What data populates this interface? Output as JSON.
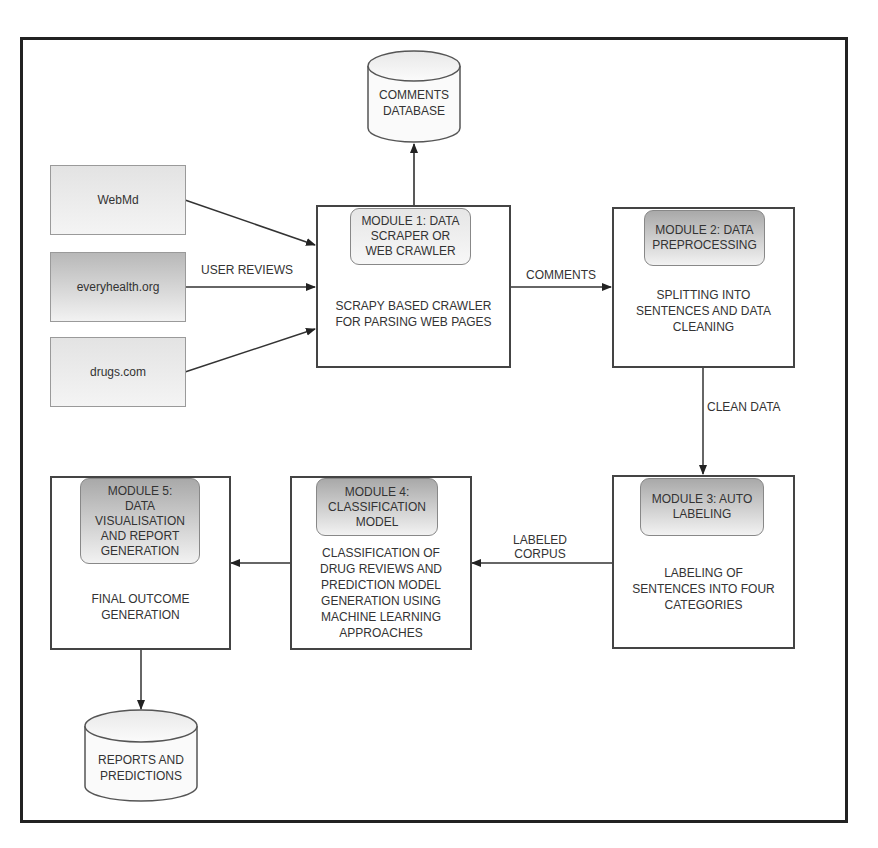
{
  "diagram": {
    "sources": [
      {
        "id": "webmd",
        "label": "WebMd"
      },
      {
        "id": "everyhealth",
        "label": "everyhealth.org"
      },
      {
        "id": "drugs",
        "label": "drugs.com"
      }
    ],
    "databases": {
      "comments": {
        "line1": "COMMENTS",
        "line2": "DATABASE"
      },
      "reports": {
        "line1": "REPORTS AND",
        "line2": "PREDICTIONS"
      }
    },
    "modules": [
      {
        "id": "m1",
        "title": [
          "MODULE 1: DATA",
          "SCRAPER OR",
          "WEB CRAWLER"
        ],
        "description": [
          "SCRAPY BASED CRAWLER",
          "FOR PARSING WEB PAGES"
        ]
      },
      {
        "id": "m2",
        "title": [
          "MODULE 2: DATA",
          "PREPROCESSING"
        ],
        "description": [
          "SPLITTING INTO",
          "SENTENCES AND DATA",
          "CLEANING"
        ]
      },
      {
        "id": "m3",
        "title": [
          "MODULE 3: AUTO",
          "LABELING"
        ],
        "description": [
          "LABELING OF",
          "SENTENCES INTO FOUR",
          "CATEGORIES"
        ]
      },
      {
        "id": "m4",
        "title": [
          "MODULE 4:",
          "CLASSIFICATION",
          "MODEL"
        ],
        "description": [
          "CLASSIFICATION OF",
          "DRUG REVIEWS AND",
          "PREDICTION MODEL",
          "GENERATION USING",
          "MACHINE LEARNING",
          "APPROACHES"
        ]
      },
      {
        "id": "m5",
        "title": [
          "MODULE 5:",
          "DATA",
          "VISUALISATION",
          "AND REPORT",
          "GENERATION"
        ],
        "description": [
          "FINAL OUTCOME",
          "GENERATION"
        ]
      }
    ],
    "edges": {
      "user_reviews": "USER REVIEWS",
      "comments": "COMMENTS",
      "clean_data": "CLEAN DATA",
      "labeled_corpus": [
        "LABELED",
        "CORPUS"
      ]
    },
    "colors": {
      "stroke": "#444444",
      "frame": "#222222",
      "header_gradient_top": "#a9a9a9",
      "header_gradient_bottom": "#f2f2f2",
      "text": "#333333"
    }
  }
}
